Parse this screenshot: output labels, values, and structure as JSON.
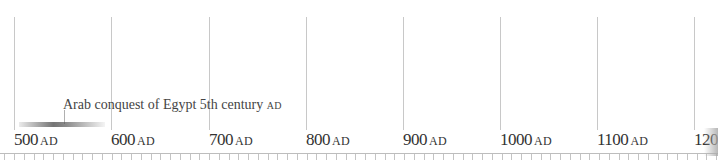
{
  "timeline": {
    "era_suffix": "AD",
    "ticks": [
      {
        "year": "500",
        "x": 14
      },
      {
        "year": "600",
        "x": 111
      },
      {
        "year": "700",
        "x": 209
      },
      {
        "year": "800",
        "x": 306
      },
      {
        "year": "900",
        "x": 403
      },
      {
        "year": "1000",
        "x": 500
      },
      {
        "year": "1100",
        "x": 597
      },
      {
        "year": "120",
        "x": 694
      }
    ],
    "event": {
      "label": "Arab conquest of Egypt 5th century",
      "era": "AD"
    }
  }
}
